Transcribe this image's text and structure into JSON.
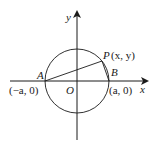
{
  "diagram": {
    "type": "coordinate-geometry",
    "colors": {
      "stroke": "#1a1a1a",
      "background": "#ffffff"
    },
    "axes": {
      "x_label": "x",
      "y_label": "y"
    },
    "origin_label": "O",
    "points": {
      "A": {
        "label": "A",
        "coords": "(−a, 0)"
      },
      "B": {
        "label": "B",
        "coords": "(a, 0)"
      },
      "P": {
        "label": "P",
        "coords": "(x, y)"
      }
    },
    "segments": [
      "AP",
      "PB"
    ],
    "shapes": [
      "circle centered at O with radius a"
    ]
  }
}
